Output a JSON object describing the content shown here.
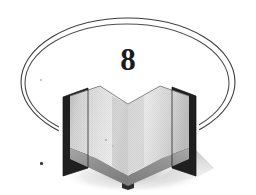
{
  "figure": {
    "kind": "chapter-opener-ornament",
    "background_color": "#ffffff",
    "chapter_number": "8"
  },
  "ellipse": {
    "name": "double-line-ellipse",
    "stroke_color": "#3c3c3c",
    "stroke_color_inner": "#555555",
    "stroke_width": 1,
    "center_x": 128,
    "center_y": 82,
    "radius_x": 107,
    "radius_y": 64,
    "inner_radius_x": 103,
    "inner_radius_y": 60,
    "line_count": 2
  },
  "book": {
    "name": "open-book-illustration",
    "style": "grayscale halftone clipart",
    "cover_color": "#1d1d1d",
    "page_light_color": "#e8e8e8",
    "page_mid_color": "#cfcfcf",
    "page_shade_color": "#9a9a9a",
    "page_edge_color": "#848484",
    "shadow_color": "#c9c9c9",
    "spine_color": "#2a2a2a",
    "left_x": 62,
    "right_x": 196,
    "top_y": 84,
    "bottom_y": 186
  },
  "specks": [
    {
      "name": "scan-speck-upper-left",
      "x": 40,
      "y": 79,
      "size": 2,
      "color": "#b9b9b9"
    },
    {
      "name": "scan-speck-lower-left",
      "x": 40,
      "y": 162,
      "size": 3,
      "color": "#3a3a3a"
    }
  ],
  "colors": {
    "ink": "#1b1b1b",
    "line": "#3c3c3c",
    "paper": "#ffffff"
  }
}
